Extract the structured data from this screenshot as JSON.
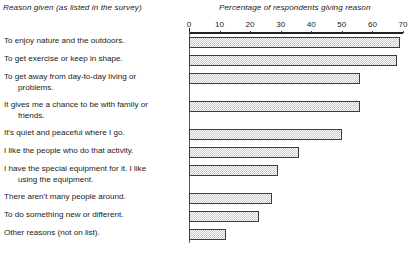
{
  "header": {
    "left_title": "Reason given (as listed in the survey)",
    "right_title": "Percentage of respondents giving reason"
  },
  "axis": {
    "tick_labels": [
      "0",
      "10",
      "20",
      "30",
      "40",
      "50",
      "60",
      "70"
    ],
    "min": 0,
    "max": 70,
    "step": 10
  },
  "colors": {
    "bar_fill": "#c9c9c9",
    "bar_border": "#3c3c3c",
    "axis": "#222222",
    "text": "#1a1a1a",
    "background": "#ffffff"
  },
  "chart_data": {
    "type": "bar",
    "orientation": "horizontal",
    "title": "",
    "xlabel": "Percentage of respondents giving reason",
    "ylabel": "Reason given (as listed in the survey)",
    "xlim": [
      0,
      70
    ],
    "grid": false,
    "legend": "none",
    "categories": [
      "To enjoy nature and the outdoors.",
      "To get exercise or keep in shape.",
      "To get away from day-to-day living or problems.",
      "It gives me a chance to be with family or friends.",
      "It's quiet and peaceful where I go.",
      "I like the people who do that activity.",
      "I have the special equipment for it. I like using the equipment.",
      "There aren't many people around.",
      "To do something new or different.",
      "Other reasons (not on list)."
    ],
    "category_lines": [
      [
        "To enjoy nature and the outdoors."
      ],
      [
        "To get exercise or keep in shape."
      ],
      [
        "To get away from day-to-day living or",
        "problems."
      ],
      [
        "It gives me a chance to be with family or",
        "friends."
      ],
      [
        "It's quiet and peaceful where I go."
      ],
      [
        "I like the people who do that activity."
      ],
      [
        "I have the special equipment for it. I like",
        "using the equipment."
      ],
      [
        "There aren't many people around."
      ],
      [
        "To do something new or different."
      ],
      [
        "Other reasons (not on list)."
      ]
    ],
    "values": [
      69,
      68,
      56,
      56,
      50,
      36,
      29,
      27,
      23,
      12
    ]
  }
}
